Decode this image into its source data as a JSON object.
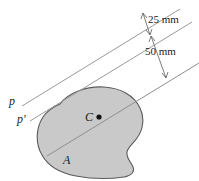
{
  "figure": {
    "colors": {
      "area_fill": "#c9c9c9",
      "area_stroke": "#5a5a5a",
      "axis_line": "#9a9a9a",
      "dimension_line": "#6e6e6e",
      "text": "#1a1a1a",
      "background": "#ffffff"
    },
    "labels": {
      "axis_p": "p",
      "axis_p_prime": "p'",
      "centroid": "C",
      "area": "A"
    },
    "dimensions": [
      {
        "id": "d1",
        "value": "25 mm",
        "between": "p and p'"
      },
      {
        "id": "d2",
        "value": "50 mm",
        "between": "p' and centroidal axis"
      }
    ],
    "geometry": {
      "axis_angle_deg": -18,
      "axes": [
        {
          "name": "p",
          "x1": 22,
          "y1": 106,
          "x2": 178,
          "y2": 10
        },
        {
          "name": "p'",
          "x1": 30,
          "y1": 121,
          "x2": 190,
          "y2": 24
        },
        {
          "name": "centroidal",
          "x1": 47,
          "y1": 155,
          "x2": 198,
          "y2": 62
        }
      ],
      "centroid_point": {
        "x": 99,
        "y": 117
      }
    }
  }
}
